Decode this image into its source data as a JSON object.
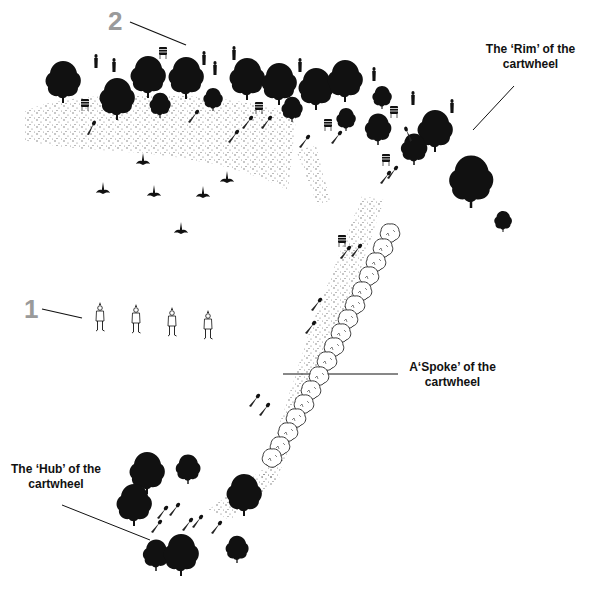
{
  "diagram": {
    "markers": [
      {
        "id": "marker-2",
        "text": "2"
      },
      {
        "id": "marker-1",
        "text": "1"
      }
    ],
    "labels": {
      "rim": {
        "line1": "The ‘Rim’ of the",
        "line2": "cartwheel"
      },
      "spoke": {
        "line1": "A‘Spoke’ of the",
        "line2": "cartwheel"
      },
      "hub": {
        "line1": "The ‘Hub’ of the",
        "line2": "cartwheel"
      }
    },
    "icons": {
      "tree": "dark-tree-icon",
      "hedge": "outline-shrub-icon",
      "person": "standing-person-icon",
      "barrel": "drum-barrel-icon",
      "dart": "missile-streak-icon",
      "bird": "bird-silhouette-icon"
    },
    "colors": {
      "ink": "#111111",
      "marker_gray": "#9a9a9a",
      "stipple": "#666666",
      "background": "#ffffff"
    }
  }
}
